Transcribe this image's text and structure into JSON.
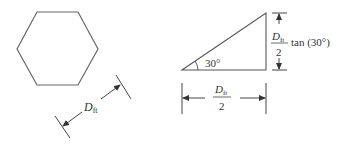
{
  "diagram": {
    "hexagon": {
      "label_var": "D",
      "label_sub": "ft"
    },
    "triangle": {
      "angle_label": "30°",
      "height_label": {
        "num_var": "D",
        "num_sub": "ft",
        "den": "2",
        "suffix": "tan (30°)"
      },
      "base_label": {
        "num_var": "D",
        "num_sub": "ft",
        "den": "2"
      }
    },
    "colors": {
      "stroke": "#555555",
      "text": "#333333",
      "background": "#ffffff"
    }
  }
}
